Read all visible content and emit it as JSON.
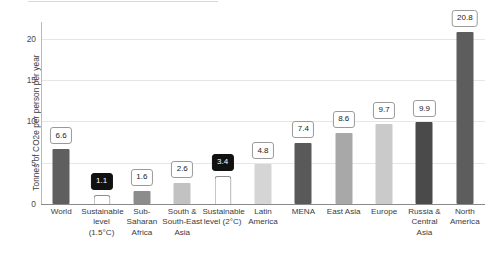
{
  "chart_data": {
    "type": "bar",
    "title": "",
    "xlabel": "",
    "ylabel": "Tonnes of CO2e per person per year",
    "ylim": [
      0,
      22
    ],
    "yticks": [
      0,
      5,
      10,
      15,
      20
    ],
    "ytick_labels": [
      "0",
      "5",
      "10",
      "15",
      "20"
    ],
    "grid": "horizontal",
    "legend": "none",
    "categories": [
      "World",
      "Sustainable level (1.5°C)",
      "Sub-Saharan Africa",
      "South & South-East Asia",
      "Sustainable level (2°C)",
      "Latin America",
      "MENA",
      "East Asia",
      "Europe",
      "Russia & Central Asia",
      "North America"
    ],
    "values": [
      6.6,
      1.1,
      1.6,
      2.6,
      3.4,
      4.8,
      7.4,
      8.6,
      9.7,
      9.9,
      20.8
    ],
    "value_labels": [
      "6.6",
      "1.1",
      "1.6",
      "2.6",
      "3.4",
      "4.8",
      "7.4",
      "8.6",
      "9.7",
      "9.9",
      "20.8"
    ],
    "bars": [
      {
        "label": "World",
        "label_lines": [
          "World"
        ],
        "value": 6.6,
        "value_label": "6.6",
        "style": "filled",
        "color": "#5f5f5f",
        "badge": "light"
      },
      {
        "label": "Sustainable level (1.5°C)",
        "label_lines": [
          "Sustainable",
          "level (1.5°C)"
        ],
        "value": 1.1,
        "value_label": "1.1",
        "style": "hollow",
        "color": "#ffffff",
        "badge": "dark"
      },
      {
        "label": "Sub-Saharan Africa",
        "label_lines": [
          "Sub-",
          "Saharan",
          "Africa"
        ],
        "value": 1.6,
        "value_label": "1.6",
        "style": "filled",
        "color": "#8c8c8c",
        "badge": "light"
      },
      {
        "label": "South & South-East Asia",
        "label_lines": [
          "South &",
          "South-East",
          "Asia"
        ],
        "value": 2.6,
        "value_label": "2.6",
        "style": "filled",
        "color": "#c2c2c2",
        "badge": "light"
      },
      {
        "label": "Sustainable level (2°C)",
        "label_lines": [
          "Sustainable",
          "level (2°C)"
        ],
        "value": 3.4,
        "value_label": "3.4",
        "style": "hollow",
        "color": "#ffffff",
        "badge": "dark"
      },
      {
        "label": "Latin America",
        "label_lines": [
          "Latin",
          "America"
        ],
        "value": 4.8,
        "value_label": "4.8",
        "style": "filled",
        "color": "#d5d5d5",
        "badge": "light"
      },
      {
        "label": "MENA",
        "label_lines": [
          "MENA"
        ],
        "value": 7.4,
        "value_label": "7.4",
        "style": "filled",
        "color": "#595959",
        "badge": "light"
      },
      {
        "label": "East Asia",
        "label_lines": [
          "East Asia"
        ],
        "value": 8.6,
        "value_label": "8.6",
        "style": "filled",
        "color": "#a8a8a8",
        "badge": "light"
      },
      {
        "label": "Europe",
        "label_lines": [
          "Europe"
        ],
        "value": 9.7,
        "value_label": "9.7",
        "style": "filled",
        "color": "#cacaca",
        "badge": "light"
      },
      {
        "label": "Russia & Central Asia",
        "label_lines": [
          "Russia &",
          "Central Asia"
        ],
        "value": 9.9,
        "value_label": "9.9",
        "style": "filled",
        "color": "#4a4a4a",
        "badge": "light"
      },
      {
        "label": "North America",
        "label_lines": [
          "North",
          "America"
        ],
        "value": 20.8,
        "value_label": "20.8",
        "style": "filled",
        "color": "#5d5d5d",
        "badge": "light"
      }
    ],
    "colors": {
      "grid": "#e6e6e6",
      "axis": "#8a8a8a",
      "text": "#3b3b3b",
      "badge_dark_bg": "#111111",
      "badge_light_bg": "#ffffff"
    }
  }
}
